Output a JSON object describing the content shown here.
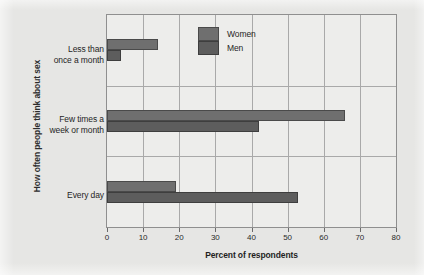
{
  "chart_data": {
    "type": "bar",
    "orientation": "horizontal",
    "title": "",
    "xlabel": "Percent of respondents",
    "ylabel": "How often people think about sex",
    "categories": [
      "Less than once a month",
      "Few times a week or month",
      "Every day"
    ],
    "category_lines": [
      [
        "Less than",
        "once a month"
      ],
      [
        "Few times a",
        "week or month"
      ],
      [
        "Every day"
      ]
    ],
    "series": [
      {
        "name": "Women",
        "color": "#6f6f6f",
        "values": [
          14,
          66,
          19
        ]
      },
      {
        "name": "Men",
        "color": "#5d5d5d",
        "values": [
          4,
          42,
          53
        ]
      }
    ],
    "xlim": [
      0,
      80
    ],
    "xticks": [
      0,
      10,
      20,
      30,
      40,
      50,
      60,
      70,
      80
    ],
    "xtick_labels": [
      "0",
      "10",
      "20",
      "30",
      "40",
      "50",
      "60",
      "70",
      "80"
    ],
    "grid": "vertical-and-group-separators",
    "legend_position": "top-right",
    "legend_entries": [
      "Women",
      "Men"
    ]
  },
  "colors": {
    "page_background": "#e6e6e4",
    "plot_background": "#ededeb",
    "frame": "#8f8f8f",
    "gridline": "#a9a9a9",
    "women_bar": "#6f6f6f",
    "men_bar": "#5d5d5d",
    "text": "#1f1f1f"
  }
}
